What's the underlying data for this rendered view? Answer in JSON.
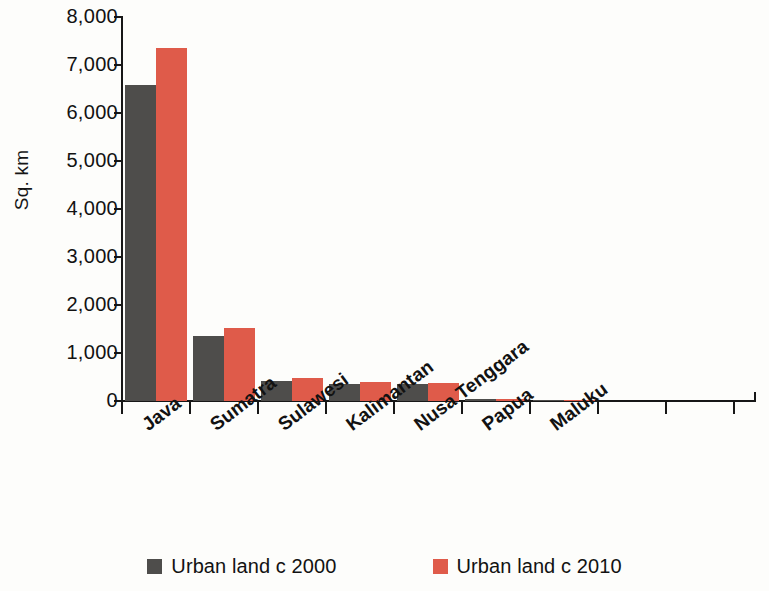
{
  "chart_data": {
    "type": "bar",
    "title": "",
    "subtitle": "",
    "xlabel": "",
    "ylabel": "Sq. km",
    "categories": [
      "Java",
      "Sumatra",
      "Sulawesi",
      "Kalimantan",
      "Nusa Tenggara",
      "Papua",
      "Maluku"
    ],
    "series": [
      {
        "name": "Urban land c 2000",
        "color": "#4e4d4b",
        "values": [
          6580,
          1360,
          420,
          350,
          355,
          40,
          12
        ]
      },
      {
        "name": "Urban land c 2010",
        "color": "#df5b4a",
        "values": [
          7350,
          1525,
          480,
          400,
          380,
          50,
          18
        ]
      }
    ],
    "ylim": [
      0,
      8000
    ],
    "yticks": [
      0,
      1000,
      2000,
      3000,
      4000,
      5000,
      6000,
      7000,
      8000
    ],
    "ytick_labels": [
      "0",
      "1,000",
      "2,000",
      "3,000",
      "4,000",
      "5,000",
      "6,000",
      "7,000",
      "8,000"
    ],
    "grid": false,
    "legend_position": "bottom",
    "x_tick_label_rotation": -37
  },
  "legend": {
    "items": [
      {
        "label": "Urban land c 2000",
        "color": "#4e4d4b",
        "swatch_name": "legend-swatch-urban-2000"
      },
      {
        "label": "Urban land c 2010",
        "color": "#df5b4a",
        "swatch_name": "legend-swatch-urban-2010"
      }
    ]
  },
  "colors": {
    "series_2000": "#4e4d4b",
    "series_2010": "#df5b4a",
    "axis": "#171717",
    "text": "#121212",
    "background": "#fdfdfb"
  }
}
